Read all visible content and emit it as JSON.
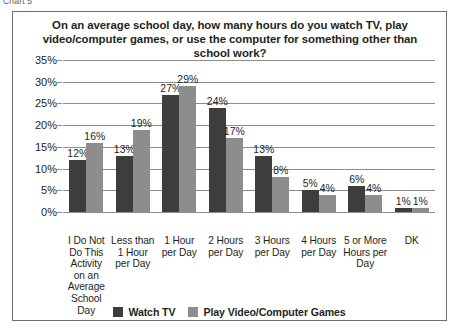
{
  "chart_label": "Chart 5",
  "chart_data": {
    "type": "bar",
    "title": "On an average school day, how many hours do you watch TV, play video/computer games, or use the computer for something other than school work?",
    "xlabel": "",
    "ylabel": "",
    "ylim": [
      0,
      35
    ],
    "y_ticks": [
      "0%",
      "5%",
      "10%",
      "15%",
      "20%",
      "25%",
      "30%",
      "35%"
    ],
    "y_tick_values": [
      0,
      5,
      10,
      15,
      20,
      25,
      30,
      35
    ],
    "grid": true,
    "legend_position": "bottom",
    "categories": [
      "I Do Not Do This Activity on an Average School Day",
      "Less than 1 Hour per Day",
      "1 Hour per Day",
      "2 Hours per Day",
      "3 Hours per Day",
      "4 Hours per Day",
      "5 or More Hours per Day",
      "DK"
    ],
    "series": [
      {
        "name": "Watch TV",
        "color": "#3d3d3d",
        "values": [
          12,
          13,
          27,
          24,
          13,
          5,
          6,
          1
        ],
        "labels": [
          "12%",
          "13%",
          "27%",
          "24%",
          "13%",
          "5%",
          "6%",
          "1%"
        ]
      },
      {
        "name": "Play Video/Computer Games",
        "color": "#8d8d8d",
        "values": [
          16,
          19,
          29,
          17,
          8,
          4,
          4,
          1
        ],
        "labels": [
          "16%",
          "19%",
          "29%",
          "17%",
          "8%",
          "4%",
          "4%",
          "1%"
        ]
      }
    ]
  }
}
